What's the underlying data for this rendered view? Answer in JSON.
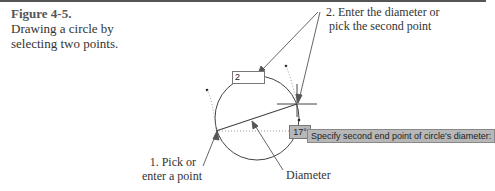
{
  "caption": {
    "figure_number": "Figure 4-5.",
    "text_line1": "Drawing a circle by",
    "text_line2": "selecting two points."
  },
  "callouts": {
    "step2_line1": "2. Enter the diameter or",
    "step2_line2": "pick the second point",
    "step1_line1": "1. Pick or",
    "step1_line2": "enter a point",
    "diameter": "Diameter"
  },
  "cad": {
    "dynamic_input_value": "2",
    "angle_value": "17°",
    "command_prompt": "Specify second end point of circle's diameter:"
  }
}
